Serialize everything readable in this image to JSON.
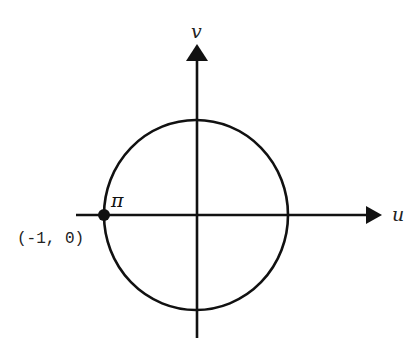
{
  "diagram": {
    "type": "unit-circle-in-uv-plane",
    "axes": {
      "horizontal_label": "u",
      "vertical_label": "v"
    },
    "circle": {
      "center": [
        0,
        0
      ],
      "radius": 1
    },
    "point": {
      "label": "π",
      "coordinates_label": "(-1, 0)",
      "coordinates": [
        -1,
        0
      ]
    },
    "colors": {
      "stroke": "#111111",
      "background": "#ffffff"
    }
  }
}
